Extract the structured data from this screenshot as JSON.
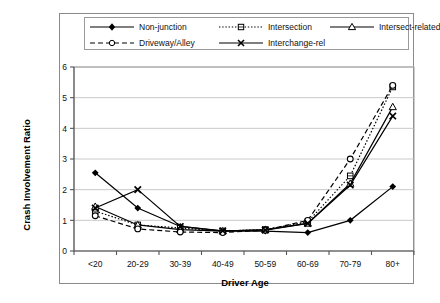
{
  "chart_data": {
    "type": "line",
    "title": "",
    "xlabel": "Driver Age",
    "ylabel": "Crash Involvement Ratio",
    "categories": [
      "<20",
      "20-29",
      "30-39",
      "40-49",
      "50-59",
      "60-69",
      "70-79",
      "80+"
    ],
    "ylim": [
      0,
      6
    ],
    "yticks": [
      0,
      1,
      2,
      3,
      4,
      5,
      6
    ],
    "grid": true,
    "legend_position": "top",
    "series": [
      {
        "name": "Non-junction",
        "marker": "filled-diamond",
        "line_style": "solid",
        "color": "#000000",
        "values": [
          2.55,
          1.4,
          0.8,
          0.65,
          0.65,
          0.6,
          1.0,
          2.1
        ]
      },
      {
        "name": "Intersection",
        "marker": "small-square",
        "line_style": "dotted",
        "color": "#000000",
        "values": [
          1.3,
          0.85,
          0.75,
          0.65,
          0.7,
          0.95,
          2.45,
          5.35
        ]
      },
      {
        "name": "Intersect-related",
        "marker": "open-triangle",
        "line_style": "solid",
        "color": "#000000",
        "values": [
          1.45,
          0.85,
          0.7,
          0.65,
          0.7,
          0.9,
          2.2,
          4.7
        ]
      },
      {
        "name": "Driveway/Alley",
        "marker": "open-circle",
        "line_style": "dashed",
        "color": "#000000",
        "values": [
          1.15,
          0.72,
          0.62,
          0.6,
          0.68,
          1.0,
          3.0,
          5.4
        ]
      },
      {
        "name": "Interchange-rel",
        "marker": "cross-x",
        "line_style": "solid",
        "color": "#000000",
        "values": [
          1.4,
          2.0,
          0.8,
          0.66,
          0.68,
          0.9,
          2.15,
          4.4
        ]
      }
    ]
  },
  "legend": {
    "items": [
      {
        "label": "Non-junction"
      },
      {
        "label": "Intersection"
      },
      {
        "label": "Intersect-related"
      },
      {
        "label": "Driveway/Alley"
      },
      {
        "label": "Interchange-rel"
      }
    ]
  },
  "axes": {
    "y_label": "Crash Involvement Ratio",
    "x_label": "Driver Age",
    "y_tick_labels": [
      "0",
      "1",
      "2",
      "3",
      "4",
      "5",
      "6"
    ],
    "x_tick_labels": [
      "<20",
      "20-29",
      "30-39",
      "40-49",
      "50-59",
      "60-69",
      "70-79",
      "80+"
    ]
  }
}
